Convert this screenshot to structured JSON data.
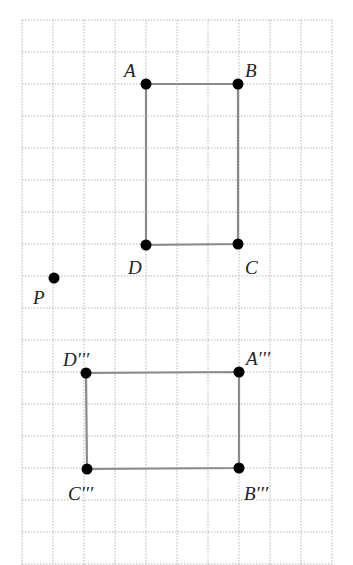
{
  "diagram": {
    "grid": {
      "x_lines": [
        22,
        53,
        84,
        115,
        146,
        177,
        208,
        239,
        270,
        301,
        332
      ],
      "y_lines": [
        20,
        52,
        84,
        116,
        148,
        180,
        212,
        244,
        276,
        308,
        340,
        372,
        404,
        436,
        468,
        500,
        532,
        564
      ],
      "color": "#b5b5b5"
    },
    "stroke_color": "#8a8a8a",
    "point_color": "#000000",
    "rect_original": {
      "points": [
        {
          "name": "A",
          "label": "A",
          "x": 146,
          "y": 84,
          "lx": 124,
          "ly": 77
        },
        {
          "name": "B",
          "label": "B",
          "x": 238,
          "y": 84,
          "lx": 245,
          "ly": 77
        },
        {
          "name": "C",
          "label": "C",
          "x": 238,
          "y": 244,
          "lx": 245,
          "ly": 274
        },
        {
          "name": "D",
          "label": "D",
          "x": 146,
          "y": 245,
          "lx": 128,
          "ly": 274
        }
      ]
    },
    "point_P": {
      "name": "P",
      "label": "P",
      "x": 54,
      "y": 278,
      "lx": 33,
      "ly": 304
    },
    "rect_image": {
      "points": [
        {
          "name": "A'''",
          "label": "A′′′",
          "x": 239,
          "y": 372,
          "lx": 246,
          "ly": 365
        },
        {
          "name": "B'''",
          "label": "B′′′",
          "x": 239,
          "y": 468,
          "lx": 244,
          "ly": 500
        },
        {
          "name": "C'''",
          "label": "C′′′",
          "x": 87,
          "y": 469,
          "lx": 68,
          "ly": 500
        },
        {
          "name": "D'''",
          "label": "D′′′",
          "x": 86,
          "y": 373,
          "lx": 63,
          "ly": 366
        }
      ]
    }
  }
}
